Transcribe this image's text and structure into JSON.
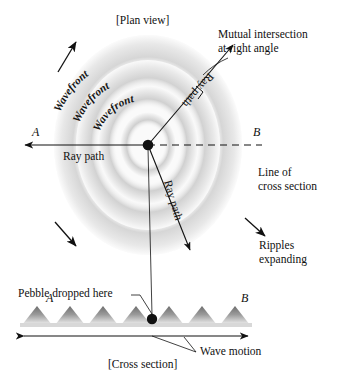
{
  "figure": {
    "plan_view_caption": "[Plan view]",
    "cross_section_caption": "[Cross section]"
  },
  "plan": {
    "wavefront_label_1": "Wavefront",
    "wavefront_label_2": "Wavefront",
    "wavefront_label_3": "Wavefront",
    "ray_path_horizontal": "Ray path",
    "ray_path_diagonal_up": "Ray path",
    "ray_path_diagonal_down": "Ray path",
    "point_a": "A",
    "point_b": "B",
    "mutual_intersection_line1": "Mutual intersection",
    "mutual_intersection_line2": "at right angle",
    "line_of_cross_line1": "Line of",
    "line_of_cross_line2": "cross section",
    "ripples_line1": "Ripples",
    "ripples_line2": "expanding"
  },
  "cross": {
    "pebble_label": "Pebble dropped here",
    "point_a": "A",
    "point_b": "B",
    "wave_motion_label": "Wave motion"
  },
  "colors": {
    "ink": "#111111",
    "ripple_light": "#f2f2f2",
    "ripple_mid": "#e2e2e2",
    "ripple_dark": "#cccccc",
    "wave_fill": "#8d8d8d",
    "background": "#ffffff"
  }
}
